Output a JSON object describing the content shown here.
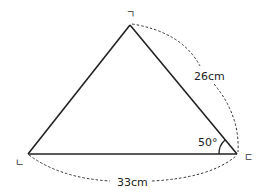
{
  "diagram": {
    "type": "triangle",
    "vertices": [
      {
        "name": "ㄱ",
        "position": "top",
        "x": 130,
        "y": 25
      },
      {
        "name": "ㄴ",
        "position": "bottom-left",
        "x": 28,
        "y": 154
      },
      {
        "name": "ㄷ",
        "position": "bottom-right",
        "x": 237,
        "y": 154
      }
    ],
    "vertex_labels": {
      "top": "ㄱ",
      "bottom_left": "ㄴ",
      "bottom_right": "ㄷ"
    },
    "measurements": {
      "side_right": "26cm",
      "side_bottom": "33cm",
      "angle_bottom_right": "50°"
    },
    "colors": {
      "line": "#222222",
      "dashed": "#333333",
      "background": "#ffffff"
    }
  }
}
